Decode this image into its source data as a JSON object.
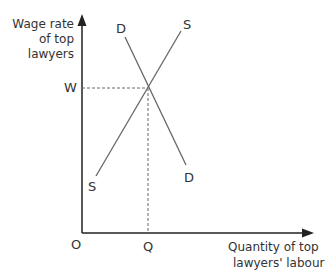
{
  "diagram": {
    "type": "supply-demand",
    "y_axis_label": [
      "Wage rate",
      "of top",
      "lawyers"
    ],
    "x_axis_label": [
      "Quantity of top",
      "lawyers' labour"
    ],
    "origin_label": "O",
    "equilibrium_wage_label": "W",
    "equilibrium_quantity_label": "Q",
    "supply_label_top": "S",
    "supply_label_bottom": "S",
    "demand_label_top": "D",
    "demand_label_bottom": "D",
    "line_color": "#666666",
    "axis_color": "#222222"
  }
}
